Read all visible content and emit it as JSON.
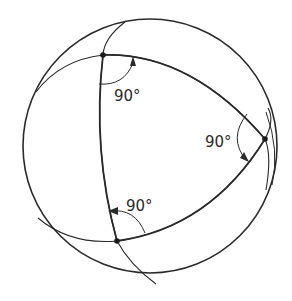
{
  "diagram": {
    "sphere": {
      "cx": 150,
      "cy": 146,
      "r": 127
    },
    "vertices": [
      {
        "id": "A",
        "x": 103,
        "y": 55
      },
      {
        "id": "B",
        "x": 265,
        "y": 139
      },
      {
        "id": "C",
        "x": 117,
        "y": 241
      }
    ],
    "angles": [
      {
        "vertex": "A",
        "label": "90°",
        "label_x": 114,
        "label_y": 101
      },
      {
        "vertex": "B",
        "label": "90°",
        "label_x": 205,
        "label_y": 147
      },
      {
        "vertex": "C",
        "label": "90°",
        "label_x": 126,
        "label_y": 211
      }
    ],
    "colors": {
      "stroke": "#2a2a2a",
      "background": "#ffffff"
    }
  }
}
